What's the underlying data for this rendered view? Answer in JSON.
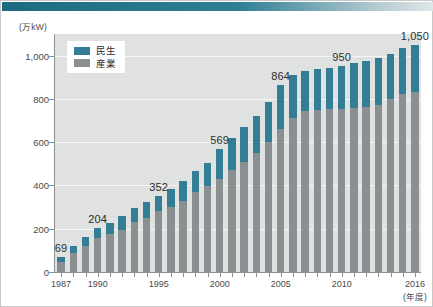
{
  "chart_data": {
    "type": "bar",
    "stacked": true,
    "title": "",
    "xlabel": "(年度)",
    "ylabel": "(万kW)",
    "ylim": [
      0,
      1100
    ],
    "yticks": [
      0,
      200,
      400,
      600,
      800,
      1000
    ],
    "ytick_labels": [
      "0",
      "200",
      "400",
      "600",
      "800",
      "1,000"
    ],
    "grid": true,
    "legend_position": "top-left",
    "categories": [
      "1987",
      "1988",
      "1989",
      "1990",
      "1991",
      "1992",
      "1993",
      "1994",
      "1995",
      "1996",
      "1997",
      "1998",
      "1999",
      "2000",
      "2001",
      "2002",
      "2003",
      "2004",
      "2005",
      "2006",
      "2007",
      "2008",
      "2009",
      "2010",
      "2011",
      "2012",
      "2013",
      "2014",
      "2015",
      "2016"
    ],
    "xtick_labels": [
      "1987",
      "1990",
      "1995",
      "2000",
      "2005",
      "2010",
      "2016"
    ],
    "xtick_categories": [
      "1987",
      "1990",
      "1995",
      "2000",
      "2005",
      "2010",
      "2016"
    ],
    "series": [
      {
        "name": "産業",
        "color": "#8a8f91",
        "values": [
          48,
          86,
          118,
          158,
          176,
          196,
          232,
          248,
          282,
          300,
          330,
          368,
          396,
          432,
          470,
          510,
          548,
          600,
          660,
          714,
          742,
          750,
          752,
          754,
          760,
          764,
          772,
          800,
          822,
          832
        ]
      },
      {
        "name": "民生",
        "color": "#337d95",
        "values": [
          21,
          34,
          42,
          46,
          52,
          62,
          66,
          76,
          70,
          84,
          92,
          100,
          108,
          137,
          148,
          158,
          172,
          184,
          204,
          196,
          188,
          190,
          192,
          196,
          204,
          210,
          216,
          206,
          212,
          218
        ]
      }
    ],
    "totals": [
      69,
      120,
      160,
      204,
      228,
      258,
      298,
      324,
      352,
      384,
      422,
      468,
      504,
      569,
      618,
      668,
      720,
      784,
      864,
      910,
      930,
      940,
      944,
      950,
      964,
      974,
      988,
      1006,
      1034,
      1050
    ],
    "annotations": [
      {
        "category": "1987",
        "text": "69",
        "value": 69
      },
      {
        "category": "1990",
        "text": "204",
        "value": 204
      },
      {
        "category": "1995",
        "text": "352",
        "value": 352
      },
      {
        "category": "2000",
        "text": "569",
        "value": 569
      },
      {
        "category": "2005",
        "text": "864",
        "value": 864
      },
      {
        "category": "2010",
        "text": "950",
        "value": 950
      },
      {
        "category": "2016",
        "text": "1,050",
        "value": 1050
      }
    ]
  },
  "legend": {
    "items": [
      {
        "label": "民生",
        "color": "#337d95"
      },
      {
        "label": "産業",
        "color": "#8a8f91"
      }
    ]
  },
  "axes": {
    "y_unit": "(万kW)",
    "x_unit": "(年度)"
  },
  "colors": {
    "residential": "#337d95",
    "industrial": "#8a8f91",
    "plot_background": "#dfe2e1",
    "gridline": "#f4f6f5",
    "accent": "#1b6b82",
    "axis": "#8d9190"
  }
}
